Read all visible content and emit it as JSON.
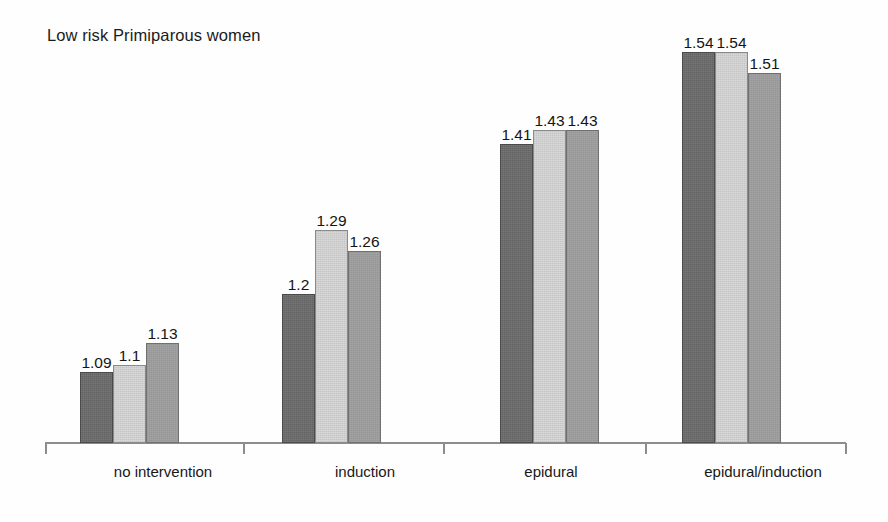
{
  "chart_data": {
    "type": "bar",
    "title": "Low risk Primiparous women",
    "subtitle": "",
    "xlabel": "",
    "ylabel": "",
    "grid": false,
    "legend_position": "none",
    "axis_baseline_value": 0.99,
    "ylim": [
      0.99,
      1.57
    ],
    "categories": [
      "no intervention",
      "induction",
      "epidural",
      "epidural/induction"
    ],
    "series": [
      {
        "name": "series-1",
        "color": "#636363",
        "values": [
          1.09,
          1.2,
          1.41,
          1.54
        ]
      },
      {
        "name": "series-2",
        "color": "#d9d9d9",
        "values": [
          1.1,
          1.29,
          1.43,
          1.54
        ]
      },
      {
        "name": "series-3",
        "color": "#9c9c9c",
        "values": [
          1.13,
          1.26,
          1.43,
          1.51
        ]
      }
    ],
    "value_labels": [
      [
        "1.09",
        "1.1",
        "1.13"
      ],
      [
        "1.2",
        "1.29",
        "1.26"
      ],
      [
        "1.41",
        "1.43",
        "1.43"
      ],
      [
        "1.54",
        "1.54",
        "1.51"
      ]
    ]
  },
  "axis": {
    "line_color": "#8d8d8d",
    "tick_positions_px": [
      45,
      243,
      443,
      645,
      845
    ]
  },
  "groups": [
    {
      "label": "no intervention",
      "left_px": 80,
      "label_center_px": 163
    },
    {
      "label": "induction",
      "left_px": 282,
      "label_center_px": 365
    },
    {
      "label": "epidural",
      "left_px": 500,
      "label_center_px": 551
    },
    {
      "label": "epidural/induction",
      "left_px": 682,
      "label_center_px": 763
    }
  ]
}
